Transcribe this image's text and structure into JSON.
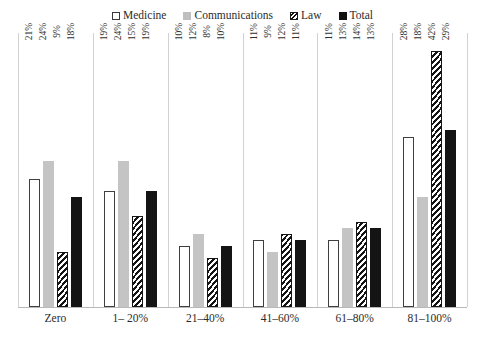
{
  "legend": {
    "items": [
      {
        "label": "Medicine",
        "swatch": "legend-swatch-medicine",
        "color": "#ffffff"
      },
      {
        "label": "Communications",
        "swatch": "legend-swatch-communications",
        "color": "#bfbfbf"
      },
      {
        "label": "Law",
        "swatch": "legend-swatch-law",
        "color": "#141414"
      },
      {
        "label": "Total",
        "swatch": "legend-swatch-total",
        "color": "#141414"
      }
    ]
  },
  "chart_data": {
    "type": "bar",
    "title": "",
    "xlabel": "",
    "ylabel": "",
    "grid": "vertical-category-separators",
    "legend_position": "top-center",
    "ylim": [
      0,
      45
    ],
    "value_suffix": "%",
    "label_orientation": "vertical",
    "categories": [
      "Zero",
      "1– 20%",
      "21–40%",
      "41–60%",
      "61–80%",
      "81–100%"
    ],
    "series": [
      {
        "name": "Medicine",
        "values": [
          21,
          19,
          10,
          11,
          11,
          28
        ],
        "labels": [
          "21%",
          "19%",
          "10%",
          "11%",
          "11%",
          "28%"
        ]
      },
      {
        "name": "Communications",
        "values": [
          24,
          24,
          12,
          9,
          13,
          18
        ],
        "labels": [
          "24%",
          "24%",
          "12%",
          "9%",
          "13%",
          "18%"
        ]
      },
      {
        "name": "Law",
        "values": [
          9,
          15,
          8,
          12,
          14,
          42
        ],
        "labels": [
          "9%",
          "15%",
          "8%",
          "12%",
          "14%",
          "42%"
        ]
      },
      {
        "name": "Total",
        "values": [
          18,
          19,
          10,
          11,
          13,
          29
        ],
        "labels": [
          "18%",
          "19%",
          "10%",
          "11%",
          "13%",
          "29%"
        ]
      }
    ]
  }
}
